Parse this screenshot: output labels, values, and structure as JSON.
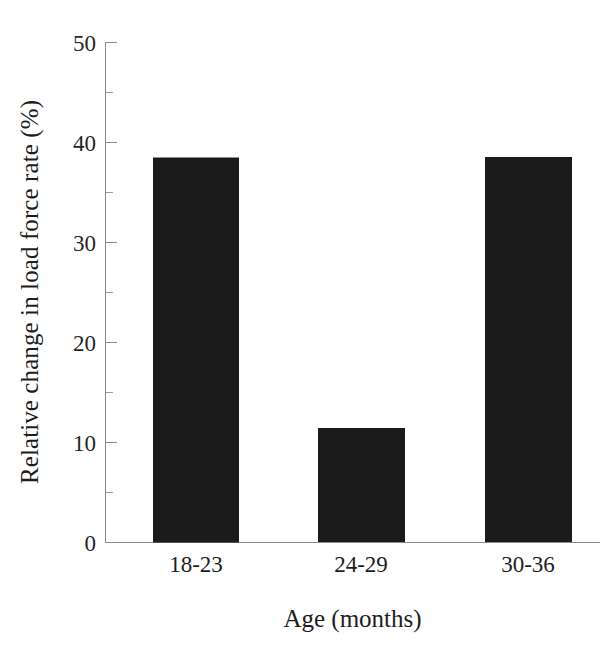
{
  "chart_data": {
    "type": "bar",
    "title": "",
    "subtitle": "",
    "xlabel": "Age (months)",
    "ylabel": "Relative change in load force rate (%)",
    "categories": [
      "18-23",
      "24-29",
      "30-36"
    ],
    "values": [
      2.4,
      11.4,
      38.5
    ],
    "series": [
      {
        "name": "Relative change in load force rate",
        "values": [
          2.4,
          11.4,
          38.5
        ]
      }
    ],
    "ylim": [
      0,
      50
    ],
    "ytick_values": [
      0,
      10,
      20,
      30,
      40,
      50
    ],
    "ytick_labels": [
      "0",
      "10",
      "20",
      "30",
      "40",
      "50"
    ],
    "yminor_tick_values": [
      5,
      15,
      25,
      35,
      45
    ],
    "grid": false,
    "legend": false,
    "legend_position": "none",
    "annotations": [],
    "bar_color": "#1b1b1b",
    "axis_color": "#8a8a8a",
    "background_color": "#ffffff"
  },
  "figure": {
    "name": "relative-change-load-force-rate-bar-chart"
  }
}
